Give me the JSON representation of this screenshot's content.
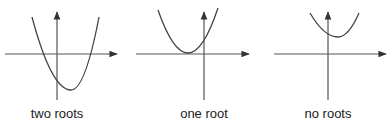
{
  "colors": {
    "axis": "#555555",
    "curve": "#444444",
    "text": "#222222"
  },
  "panels": [
    {
      "label": "two roots",
      "label_x": 57,
      "axis": {
        "x_from": 5,
        "x_to": 117,
        "y_level": 54,
        "y_axis_x": 57,
        "y_from": 100,
        "y_to": 12
      },
      "curve": {
        "vertex": [
          71,
          90
        ],
        "left_top": [
          32,
          17
        ],
        "right_top": [
          99,
          17
        ],
        "roots": [
          [
            38,
            54
          ],
          [
            93,
            54
          ]
        ]
      }
    },
    {
      "label": "one root",
      "label_x": 204,
      "axis": {
        "x_from": 136,
        "x_to": 249,
        "y_level": 54,
        "y_axis_x": 204,
        "y_from": 100,
        "y_to": 12
      },
      "curve": {
        "vertex": [
          188,
          53
        ],
        "left_top": [
          158,
          10
        ],
        "right_top": [
          218,
          8
        ],
        "roots": [
          [
            188,
            54
          ]
        ]
      }
    },
    {
      "label": "no roots",
      "label_x": 328,
      "axis": {
        "x_from": 274,
        "x_to": 386,
        "y_level": 54,
        "y_axis_x": 328,
        "y_from": 100,
        "y_to": 12
      },
      "curve": {
        "vertex": [
          338,
          37
        ],
        "left_top": [
          310,
          13
        ],
        "right_top": [
          359,
          13
        ],
        "roots": []
      }
    }
  ]
}
